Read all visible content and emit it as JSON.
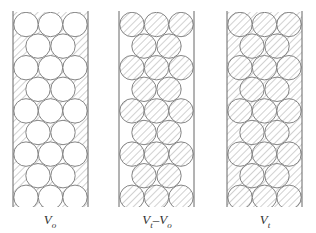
{
  "diagram": {
    "rows": [
      3,
      2,
      3,
      2,
      3,
      2,
      3,
      2,
      3
    ],
    "line_color": "#777777",
    "hatch_color": "#9a9a9a",
    "panels": [
      {
        "id": "vo",
        "label_main": "V",
        "label_sub": "o",
        "label_rest": "",
        "label_rest_sub": "",
        "circles_hatched": false,
        "voids_hatched": true
      },
      {
        "id": "vt-vo",
        "label_main": "V",
        "label_sub": "t",
        "label_rest": "–V",
        "label_rest_sub": "o",
        "circles_hatched": true,
        "voids_hatched": false
      },
      {
        "id": "vt",
        "label_main": "V",
        "label_sub": "t",
        "label_rest": "",
        "label_rest_sub": "",
        "circles_hatched": true,
        "voids_hatched": true
      }
    ]
  }
}
